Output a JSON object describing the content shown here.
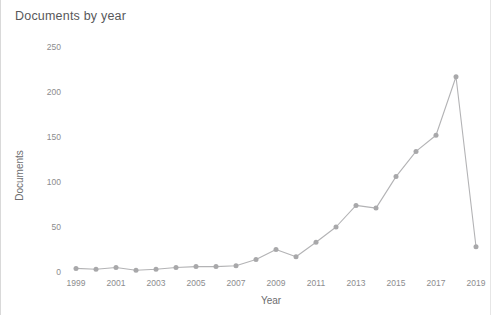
{
  "chart_data": {
    "type": "line",
    "title": "Documents by year",
    "xlabel": "Year",
    "ylabel": "Documents",
    "x": [
      1999,
      2000,
      2001,
      2002,
      2003,
      2004,
      2005,
      2006,
      2007,
      2008,
      2009,
      2010,
      2011,
      2012,
      2013,
      2014,
      2015,
      2016,
      2017,
      2018,
      2019
    ],
    "values": [
      4,
      3,
      5,
      2,
      3,
      5,
      6,
      6,
      7,
      14,
      25,
      17,
      33,
      50,
      74,
      71,
      106,
      134,
      152,
      217,
      28
    ],
    "xlim": [
      1999,
      2019
    ],
    "ylim": [
      0,
      250
    ],
    "ytick_labels": [
      "0",
      "50",
      "100",
      "150",
      "200",
      "250"
    ],
    "ytick_values": [
      0,
      50,
      100,
      150,
      200,
      250
    ],
    "xtick_labels": [
      "1999",
      "2001",
      "2003",
      "2005",
      "2007",
      "2009",
      "2011",
      "2013",
      "2015",
      "2017",
      "2019"
    ],
    "xtick_values": [
      1999,
      2001,
      2003,
      2005,
      2007,
      2009,
      2011,
      2013,
      2015,
      2017,
      2019
    ],
    "grid": false,
    "legend": "none",
    "series_color": "#b3b3b5",
    "marker": "circle"
  },
  "axis": {
    "y_ticks": [
      {
        "label": "250"
      },
      {
        "label": "200"
      },
      {
        "label": "150"
      },
      {
        "label": "100"
      },
      {
        "label": "50"
      },
      {
        "label": "0"
      }
    ],
    "x_ticks": [
      {
        "label": "1999"
      },
      {
        "label": "2001"
      },
      {
        "label": "2003"
      },
      {
        "label": "2005"
      },
      {
        "label": "2007"
      },
      {
        "label": "2009"
      },
      {
        "label": "2011"
      },
      {
        "label": "2013"
      },
      {
        "label": "2015"
      },
      {
        "label": "2017"
      },
      {
        "label": "2019"
      }
    ]
  },
  "colors": {
    "line": "#b3b3b5",
    "marker": "#a8a8aa",
    "text": "#8c8c8e",
    "title": "#58585a"
  }
}
